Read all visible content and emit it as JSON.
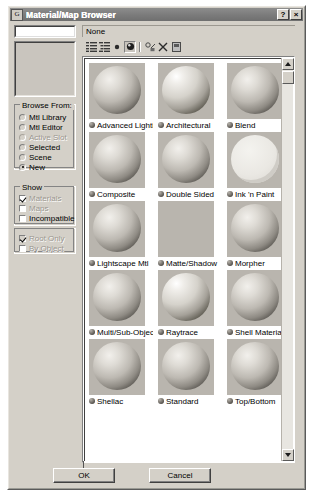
{
  "window": {
    "title": "Material/Map Browser",
    "system_icon": "G",
    "help_button": "?",
    "close_button": "×"
  },
  "left_panel": {
    "name_field": {
      "value": "",
      "placeholder": ""
    },
    "preview_label": "material-preview",
    "browse_from": {
      "legend": "Browse From:",
      "options": [
        {
          "label": "Mtl Library",
          "selected": false,
          "disabled": false
        },
        {
          "label": "Mtl Editor",
          "selected": false,
          "disabled": false
        },
        {
          "label": "Active Slot",
          "selected": false,
          "disabled": true
        },
        {
          "label": "Selected",
          "selected": false,
          "disabled": false
        },
        {
          "label": "Scene",
          "selected": false,
          "disabled": false
        },
        {
          "label": "New",
          "selected": true,
          "disabled": false
        }
      ]
    },
    "show": {
      "legend": "Show",
      "options": [
        {
          "label": "Materials",
          "checked": true,
          "disabled": false
        },
        {
          "label": "Maps",
          "checked": false,
          "disabled": false
        },
        {
          "label": "Incompatible",
          "checked": false,
          "disabled": false
        }
      ]
    },
    "flags": {
      "options": [
        {
          "label": "Root Only",
          "checked": true,
          "disabled": true
        },
        {
          "label": "By Object",
          "checked": false,
          "disabled": false
        }
      ]
    }
  },
  "toolbar": {
    "current_selection": "None",
    "buttons": [
      {
        "icon": "view-list-icon",
        "pressed": false
      },
      {
        "icon": "view-list-details-icon",
        "pressed": false
      },
      {
        "icon": "view-small-icons-icon",
        "pressed": false
      },
      {
        "icon": "view-large-icons-icon",
        "pressed": true
      },
      {
        "icon": "update-scene-icon",
        "pressed": false
      },
      {
        "icon": "delete-icon",
        "pressed": false
      },
      {
        "icon": "clear-icon",
        "pressed": false
      }
    ]
  },
  "materials": [
    {
      "name": "Advanced Lighting Override",
      "label": "Advanced Lighting",
      "style": "normal"
    },
    {
      "name": "Architectural",
      "label": "Architectural",
      "style": "hot"
    },
    {
      "name": "Blend",
      "label": "Blend",
      "style": "normal"
    },
    {
      "name": "Composite",
      "label": "Composite",
      "style": "normal"
    },
    {
      "name": "Double Sided",
      "label": "Double Sided",
      "style": "normal"
    },
    {
      "name": "Ink 'n Paint",
      "label": "Ink 'n Paint",
      "style": "flat"
    },
    {
      "name": "Lightscape Mtl",
      "label": "Lightscape Mtl",
      "style": "normal"
    },
    {
      "name": "Matte/Shadow",
      "label": "Matte/Shadow",
      "style": "blank"
    },
    {
      "name": "Morpher",
      "label": "Morpher",
      "style": "normal"
    },
    {
      "name": "Multi/Sub-Object",
      "label": "Multi/Sub-Object",
      "style": "normal"
    },
    {
      "name": "Raytrace",
      "label": "Raytrace",
      "style": "hot"
    },
    {
      "name": "Shell Material",
      "label": "Shell Material",
      "style": "normal"
    },
    {
      "name": "Shellac",
      "label": "Shellac",
      "style": "normal"
    },
    {
      "name": "Standard",
      "label": "Standard",
      "style": "normal"
    },
    {
      "name": "Top/Bottom",
      "label": "Top/Bottom",
      "style": "normal"
    }
  ],
  "footer": {
    "ok_label": "OK",
    "cancel_label": "Cancel"
  },
  "colors": {
    "face": "#d4d0c8",
    "titlebar": "#7b7b7b",
    "titlebar_text": "#ffffff",
    "list_background": "#ffffff",
    "swatch_background": "#b9b5ae",
    "disabled_text": "#9a968f"
  }
}
